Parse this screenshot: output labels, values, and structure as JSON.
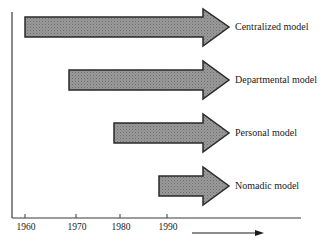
{
  "diagram": {
    "type": "timeline",
    "models": [
      {
        "label": "Centralized model",
        "start_year": 1960
      },
      {
        "label": "Departmental model",
        "start_year": 1970
      },
      {
        "label": "Personal model",
        "start_year": 1980
      },
      {
        "label": "Nomadic model",
        "start_year": 1990
      }
    ],
    "axis": {
      "ticks": [
        "1960",
        "1970",
        "1980",
        "1990"
      ],
      "direction_arrow": "time-arrow"
    },
    "colors": {
      "arrow_fill": "#8f8f8f",
      "arrow_stroke": "#2a2a2a",
      "axis": "#3a3a3a"
    }
  }
}
